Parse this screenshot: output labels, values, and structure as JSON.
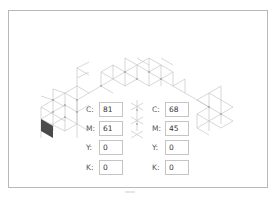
{
  "figure": {
    "left_panel": {
      "fields": [
        {
          "label": "C:",
          "value": "81"
        },
        {
          "label": "M:",
          "value": "61"
        },
        {
          "label": "Y:",
          "value": "0"
        },
        {
          "label": "K:",
          "value": "0"
        }
      ]
    },
    "right_panel": {
      "fields": [
        {
          "label": "C:",
          "value": "68"
        },
        {
          "label": "M:",
          "value": "45"
        },
        {
          "label": "Y:",
          "value": "0"
        },
        {
          "label": "K:",
          "value": "0"
        }
      ]
    },
    "colors": {
      "grid_line": "#bdbdbd",
      "grid_node": "#8a8a8a",
      "filled_cell": "#4a4a4a",
      "frame_border": "#b8b8b8"
    }
  }
}
